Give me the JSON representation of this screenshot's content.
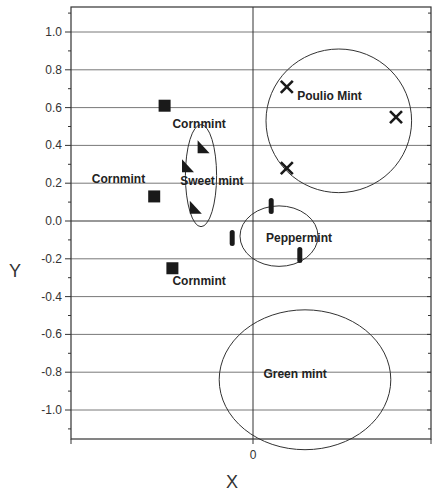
{
  "chart_data": {
    "type": "scatter",
    "title": "",
    "xlabel": "X",
    "ylabel": "Y",
    "xlim": [
      -0.72,
      0.67
    ],
    "ylim": [
      -1.15,
      1.13
    ],
    "x_ticks": [
      0
    ],
    "x_tick_labels": [
      "0"
    ],
    "y_ticks": [
      1.0,
      0.8,
      0.6,
      0.4,
      0.2,
      0.0,
      -0.2,
      -0.4,
      -0.6,
      -0.8,
      -1.0
    ],
    "y_tick_labels": [
      "1.0",
      "0.8",
      "0.6",
      "0.4",
      "0.2",
      "0.0",
      "-0.2",
      "-0.4",
      "-0.6",
      "-0.8",
      "-1.0"
    ],
    "grid": {
      "horizontal": true,
      "vertical": false
    },
    "legend": null,
    "series": [
      {
        "name": "Cornmint",
        "marker": "square",
        "points": [
          [
            -0.34,
            0.61
          ],
          [
            -0.38,
            0.13
          ],
          [
            -0.31,
            -0.25
          ]
        ]
      },
      {
        "name": "Sweet mint",
        "marker": "triangle",
        "points": [
          [
            -0.19,
            0.39
          ],
          [
            -0.25,
            0.29
          ],
          [
            -0.22,
            0.07
          ]
        ]
      },
      {
        "name": "Peppermint",
        "marker": "bar",
        "points": [
          [
            0.07,
            0.08
          ],
          [
            -0.08,
            -0.09
          ],
          [
            0.18,
            -0.18
          ]
        ]
      },
      {
        "name": "Poulio Mint",
        "marker": "x",
        "points": [
          [
            0.13,
            0.71
          ],
          [
            0.55,
            0.55
          ],
          [
            0.13,
            0.28
          ]
        ]
      },
      {
        "name": "Green mint",
        "marker": "none",
        "points": []
      }
    ],
    "annotations": [
      {
        "text": "Cornmint",
        "x": -0.31,
        "y": 0.49
      },
      {
        "text": "Cornmint",
        "x": -0.62,
        "y": 0.2
      },
      {
        "text": "Cornmint",
        "x": -0.31,
        "y": -0.34
      },
      {
        "text": "Sweet mint",
        "x": -0.28,
        "y": 0.19
      },
      {
        "text": "Peppermint",
        "x": 0.05,
        "y": -0.11
      },
      {
        "text": "Poulio Mint",
        "x": 0.17,
        "y": 0.64
      },
      {
        "text": "Green mint",
        "x": 0.04,
        "y": -0.83
      }
    ],
    "ellipses": [
      {
        "group": "Sweet mint",
        "cx": -0.2,
        "cy": 0.24,
        "rx": 0.06,
        "ry": 0.27
      },
      {
        "group": "Peppermint",
        "cx": 0.1,
        "cy": -0.08,
        "rx": 0.15,
        "ry": 0.16
      },
      {
        "group": "Poulio Mint",
        "cx": 0.33,
        "cy": 0.53,
        "rx": 0.28,
        "ry": 0.38
      },
      {
        "group": "Green mint",
        "cx": 0.2,
        "cy": -0.84,
        "rx": 0.33,
        "ry": 0.37
      }
    ]
  },
  "labels": {
    "x_axis": "X",
    "y_axis": "Y",
    "x_zero": "0"
  }
}
